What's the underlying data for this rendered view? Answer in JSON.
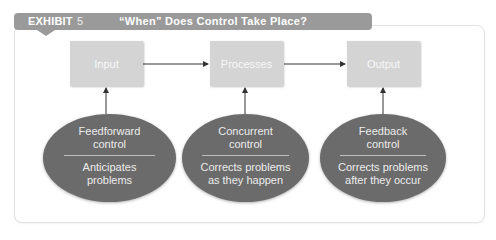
{
  "exhibit": {
    "label": "EXHIBIT",
    "number": "5",
    "title": "“When” Does Control Take Place?"
  },
  "process_boxes": [
    {
      "label": "Input"
    },
    {
      "label": "Processes"
    },
    {
      "label": "Output"
    }
  ],
  "controls": [
    {
      "name_line1": "Feedforward",
      "name_line2": "control",
      "desc_line1": "Anticipates",
      "desc_line2": "problems"
    },
    {
      "name_line1": "Concurrent",
      "name_line2": "control",
      "desc_line1": "Corrects problems",
      "desc_line2": "as they happen"
    },
    {
      "name_line1": "Feedback",
      "name_line2": "control",
      "desc_line1": "Corrects problems",
      "desc_line2": "after they occur"
    }
  ],
  "colors": {
    "title_bar": "#9a9a9a",
    "box_fill": "#d4d4d4",
    "ellipse_fill": "#6b6b6b",
    "arrow": "#333333"
  }
}
